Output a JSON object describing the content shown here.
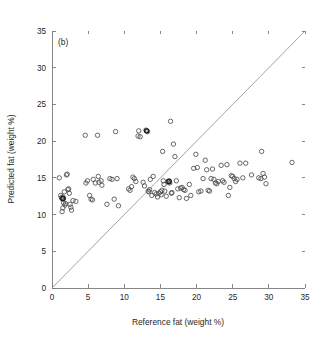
{
  "figure": {
    "panel_label": "(b)",
    "background_color": "#ffffff",
    "marker_color": "#4d4d4d",
    "line_color": "#8c8c8c",
    "axis_color": "#7a7a7a"
  },
  "chart_data": {
    "type": "scatter",
    "title": "",
    "subtitle": "",
    "xlabel": "Reference fat (weight %)",
    "ylabel": "Predicted fat (weight %)",
    "annotation": "(b)",
    "xlim": [
      0,
      35
    ],
    "ylim": [
      0,
      35
    ],
    "xticks": [
      0,
      5,
      10,
      15,
      20,
      25,
      30,
      35
    ],
    "yticks": [
      0,
      5,
      10,
      15,
      20,
      25,
      30,
      35
    ],
    "xticklabels": [
      "0",
      "5",
      "10",
      "15",
      "20",
      "25",
      "30",
      "35"
    ],
    "yticklabels": [
      "0",
      "5",
      "10",
      "15",
      "20",
      "25",
      "30",
      "35"
    ],
    "grid": false,
    "legend": null,
    "legend_position": "none",
    "marker": "open-circle",
    "marker_size": 3.2,
    "reference_line": {
      "label": "1:1 identity line",
      "slope": 1,
      "intercept": 0,
      "from": [
        0,
        0
      ],
      "to": [
        35,
        35
      ]
    },
    "series": [
      {
        "name": "Samples",
        "points": [
          [
            1.0,
            15.0
          ],
          [
            1.2,
            12.6
          ],
          [
            1.3,
            12.3
          ],
          [
            1.4,
            12.2
          ],
          [
            1.5,
            12.1
          ],
          [
            1.5,
            12.4
          ],
          [
            1.6,
            12.2
          ],
          [
            1.6,
            11.6
          ],
          [
            1.7,
            13.1
          ],
          [
            1.4,
            10.4
          ],
          [
            1.5,
            10.9
          ],
          [
            1.8,
            11.3
          ],
          [
            1.9,
            11.5
          ],
          [
            2.0,
            15.4
          ],
          [
            2.1,
            15.5
          ],
          [
            2.2,
            13.4
          ],
          [
            2.3,
            13.5
          ],
          [
            2.4,
            12.9
          ],
          [
            2.5,
            11.4
          ],
          [
            2.6,
            11.0
          ],
          [
            2.7,
            10.6
          ],
          [
            2.9,
            11.9
          ],
          [
            3.3,
            11.8
          ],
          [
            4.6,
            20.8
          ],
          [
            4.7,
            14.3
          ],
          [
            4.9,
            14.6
          ],
          [
            5.2,
            12.6
          ],
          [
            5.4,
            12.1
          ],
          [
            5.6,
            12.0
          ],
          [
            5.7,
            14.8
          ],
          [
            6.0,
            14.3
          ],
          [
            6.3,
            20.8
          ],
          [
            6.4,
            15.2
          ],
          [
            6.5,
            14.4
          ],
          [
            6.8,
            14.6
          ],
          [
            6.9,
            14.0
          ],
          [
            7.6,
            11.4
          ],
          [
            8.0,
            14.9
          ],
          [
            8.3,
            14.8
          ],
          [
            8.6,
            12.1
          ],
          [
            8.8,
            21.3
          ],
          [
            9.0,
            14.9
          ],
          [
            9.2,
            11.2
          ],
          [
            10.6,
            13.5
          ],
          [
            10.8,
            13.3
          ],
          [
            11.0,
            13.8
          ],
          [
            11.2,
            15.1
          ],
          [
            11.4,
            14.9
          ],
          [
            11.6,
            14.5
          ],
          [
            11.9,
            20.7
          ],
          [
            12.0,
            21.4
          ],
          [
            12.2,
            20.6
          ],
          [
            12.6,
            14.4
          ],
          [
            12.8,
            13.9
          ],
          [
            13.0,
            21.5
          ],
          [
            13.1,
            21.4
          ],
          [
            13.2,
            21.3
          ],
          [
            13.3,
            13.2
          ],
          [
            13.4,
            13.1
          ],
          [
            13.5,
            13.4
          ],
          [
            13.6,
            14.8
          ],
          [
            13.8,
            12.6
          ],
          [
            14.0,
            15.2
          ],
          [
            14.2,
            13.0
          ],
          [
            14.4,
            12.8
          ],
          [
            14.6,
            12.4
          ],
          [
            14.8,
            12.9
          ],
          [
            15.0,
            13.1
          ],
          [
            15.1,
            12.7
          ],
          [
            15.2,
            13.3
          ],
          [
            15.3,
            18.6
          ],
          [
            15.4,
            14.6
          ],
          [
            15.5,
            14.1
          ],
          [
            15.6,
            13.2
          ],
          [
            15.8,
            12.5
          ],
          [
            16.0,
            14.5
          ],
          [
            16.1,
            14.4
          ],
          [
            16.2,
            14.6
          ],
          [
            16.3,
            14.3
          ],
          [
            16.4,
            22.7
          ],
          [
            16.5,
            12.9
          ],
          [
            16.6,
            13.0
          ],
          [
            16.8,
            19.6
          ],
          [
            17.0,
            17.9
          ],
          [
            17.2,
            14.6
          ],
          [
            17.4,
            13.5
          ],
          [
            17.6,
            12.3
          ],
          [
            17.8,
            13.6
          ],
          [
            18.0,
            13.7
          ],
          [
            18.2,
            13.4
          ],
          [
            18.4,
            13.3
          ],
          [
            18.6,
            12.2
          ],
          [
            19.0,
            14.1
          ],
          [
            19.2,
            12.6
          ],
          [
            19.6,
            16.3
          ],
          [
            19.9,
            18.2
          ],
          [
            20.1,
            16.4
          ],
          [
            20.3,
            13.1
          ],
          [
            20.6,
            13.2
          ],
          [
            20.9,
            14.9
          ],
          [
            21.2,
            17.4
          ],
          [
            21.4,
            16.1
          ],
          [
            21.6,
            13.3
          ],
          [
            21.8,
            13.2
          ],
          [
            22.0,
            14.9
          ],
          [
            22.2,
            16.2
          ],
          [
            22.4,
            14.8
          ],
          [
            22.6,
            14.3
          ],
          [
            22.8,
            14.2
          ],
          [
            23.0,
            14.5
          ],
          [
            23.4,
            16.7
          ],
          [
            23.6,
            14.6
          ],
          [
            23.8,
            14.4
          ],
          [
            24.2,
            16.8
          ],
          [
            24.4,
            12.6
          ],
          [
            24.6,
            13.7
          ],
          [
            24.8,
            15.3
          ],
          [
            25.0,
            15.2
          ],
          [
            25.2,
            14.9
          ],
          [
            25.4,
            14.5
          ],
          [
            25.6,
            14.8
          ],
          [
            26.0,
            17.0
          ],
          [
            26.4,
            15.0
          ],
          [
            26.8,
            17.0
          ],
          [
            27.6,
            15.4
          ],
          [
            28.6,
            15.0
          ],
          [
            28.9,
            14.9
          ],
          [
            29.0,
            18.6
          ],
          [
            29.2,
            15.6
          ],
          [
            29.4,
            15.1
          ],
          [
            29.6,
            14.2
          ],
          [
            33.2,
            17.1
          ]
        ],
        "dark_points": [
          [
            1.5,
            12.2
          ],
          [
            13.1,
            21.4
          ],
          [
            16.2,
            14.5
          ]
        ],
        "n": 132
      }
    ]
  }
}
